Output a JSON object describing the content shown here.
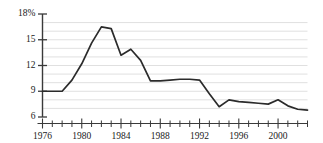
{
  "chart_data": {
    "type": "line",
    "title": "",
    "subtitle": "",
    "xlabel": "",
    "ylabel": "",
    "xlim": [
      1976,
      2003
    ],
    "ylim": [
      6,
      18
    ],
    "grid": true,
    "legend": null,
    "legend_position": "none",
    "line_color": "#2b2b2b",
    "grid_color": "#d8d8d8",
    "axis_color": "#3a3a3a",
    "y_ticks": [
      {
        "value": 18,
        "label": "18%"
      },
      {
        "value": 15,
        "label": "15"
      },
      {
        "value": 12,
        "label": "12"
      },
      {
        "value": 9,
        "label": "9"
      },
      {
        "value": 6,
        "label": "6"
      }
    ],
    "y_gridlines": [
      7,
      8,
      9,
      10,
      11,
      12,
      13,
      14,
      15,
      16,
      17
    ],
    "x_major_ticks": [
      {
        "value": 1976,
        "label": "1976"
      },
      {
        "value": 1980,
        "label": "1980"
      },
      {
        "value": 1984,
        "label": "1984"
      },
      {
        "value": 1988,
        "label": "1988"
      },
      {
        "value": 1992,
        "label": "1992"
      },
      {
        "value": 1996,
        "label": "1996"
      },
      {
        "value": 2000,
        "label": "2000"
      }
    ],
    "x_minor_ticks": [
      1977,
      1978,
      1979,
      1981,
      1982,
      1983,
      1985,
      1986,
      1987,
      1989,
      1990,
      1991,
      1993,
      1994,
      1995,
      1997,
      1998,
      1999,
      2001,
      2002,
      2003
    ],
    "x": [
      1976,
      1977,
      1978,
      1979,
      1980,
      1981,
      1982,
      1983,
      1984,
      1985,
      1986,
      1987,
      1988,
      1989,
      1990,
      1991,
      1992,
      1993,
      1994,
      1995,
      1996,
      1997,
      1998,
      1999,
      2000,
      2001,
      2002,
      2003
    ],
    "values": [
      9.0,
      9.0,
      9.0,
      10.3,
      12.2,
      14.6,
      16.5,
      16.3,
      13.2,
      13.9,
      12.6,
      10.2,
      10.2,
      10.3,
      10.4,
      10.4,
      10.3,
      8.7,
      7.2,
      8.0,
      7.8,
      7.7,
      7.6,
      7.5,
      8.0,
      7.3,
      6.9,
      6.8
    ],
    "series_name": "rate"
  },
  "axes": {
    "y_axis_name": "y-axis",
    "x_axis_name": "x-axis"
  }
}
